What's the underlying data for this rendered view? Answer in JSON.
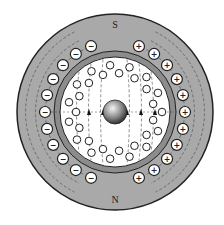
{
  "diagram": {
    "poles": {
      "top": "S",
      "bottom": "N"
    },
    "stator_conductors": {
      "left_sign": "−",
      "right_sign": "+",
      "count_per_side": 11
    },
    "rotor_conductor_count": 30,
    "colors": {
      "stator": "#a9a9a9",
      "air_gap_ring": "#8c8c8c",
      "rotor": "#ffffff",
      "outline": "#222222",
      "field_lines": "#444444",
      "shaft": "#888888"
    }
  }
}
